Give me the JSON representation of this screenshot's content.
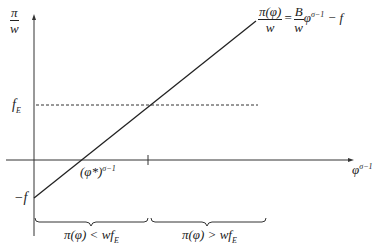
{
  "diagram": {
    "y_axis_label": {
      "numerator": "π",
      "denominator": "w"
    },
    "x_axis_label": {
      "base": "φ",
      "exponent": "σ−1"
    },
    "equation": {
      "lhs_numerator": "π(φ)",
      "lhs_denominator": "w",
      "equals": "=",
      "rhs_numerator": "B",
      "rhs_denominator": "w",
      "rhs_term": "φ",
      "rhs_exponent": "σ−1",
      "rhs_tail": " − f"
    },
    "fe_label": {
      "base": "f",
      "sub": "E"
    },
    "neg_f_label": "−f",
    "cutoff_label": {
      "base": "(φ*)",
      "exponent": "σ−1"
    },
    "brace_left_label": {
      "text": "π(φ) < wf",
      "sub": "E"
    },
    "brace_right_label": {
      "text": "π(φ) > wf",
      "sub": "E"
    }
  }
}
